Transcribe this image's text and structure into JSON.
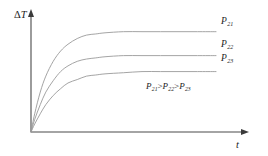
{
  "chart_data": {
    "type": "line",
    "title": "",
    "xlabel": "t",
    "ylabel": "ΔT",
    "ylabel_delta": "Δ",
    "ylabel_var": "T",
    "grid": false,
    "legend": "inline-right-labels",
    "axis_arrows": true,
    "tick_labels": [],
    "xlim": [
      0,
      100
    ],
    "ylim": [
      0,
      100
    ],
    "annotation": {
      "text": "P21>P22>P23",
      "parts": [
        {
          "base": "P",
          "sub": "21"
        },
        {
          "op": ">"
        },
        {
          "base": "P",
          "sub": "22"
        },
        {
          "op": ">"
        },
        {
          "base": "P",
          "sub": "23"
        }
      ]
    },
    "series": [
      {
        "name": "P21",
        "label_base": "P",
        "label_sub": "21",
        "plateau": 88,
        "rate": 4.2,
        "x": [
          0,
          2,
          5,
          8,
          12,
          16,
          20,
          25,
          30,
          35,
          40,
          50,
          60,
          70,
          80,
          90,
          100
        ],
        "y": [
          0,
          16,
          35,
          49,
          62,
          71,
          77,
          82,
          85,
          86,
          87,
          88,
          88,
          88,
          88,
          88,
          88
        ]
      },
      {
        "name": "P22",
        "label_base": "P",
        "label_sub": "22",
        "plateau": 67,
        "rate": 3.4,
        "x": [
          0,
          2,
          5,
          8,
          12,
          16,
          20,
          25,
          30,
          35,
          40,
          50,
          60,
          70,
          80,
          90,
          100
        ],
        "y": [
          0,
          11,
          24,
          35,
          45,
          53,
          58,
          62,
          64,
          65,
          66,
          67,
          67,
          67,
          67,
          67,
          67
        ]
      },
      {
        "name": "P23",
        "label_base": "P",
        "label_sub": "23",
        "plateau": 53,
        "rate": 2.7,
        "x": [
          0,
          2,
          5,
          8,
          12,
          16,
          20,
          25,
          30,
          35,
          40,
          50,
          60,
          70,
          80,
          90,
          100
        ],
        "y": [
          0,
          7,
          16,
          24,
          32,
          38,
          43,
          46,
          49,
          50,
          51,
          52,
          53,
          53,
          53,
          53,
          53
        ]
      }
    ],
    "colors": {
      "curve": "#9a9a9a",
      "axis": "#4a4a4a",
      "text": "#1c1c1c",
      "background": "#ffffff"
    }
  }
}
